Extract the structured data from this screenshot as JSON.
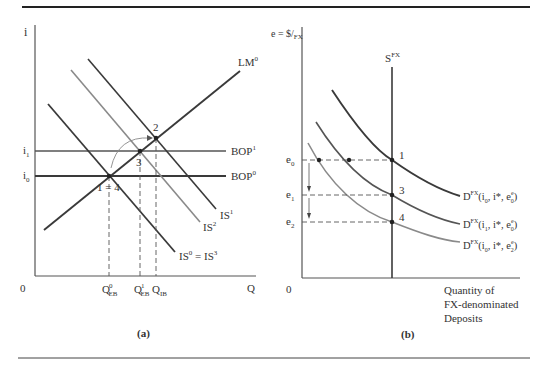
{
  "panel_a": {
    "caption": "(a)",
    "y_axis_label": "i",
    "x_axis_label": "Q",
    "origin_label": "0",
    "y_ticks": [
      {
        "base": "i",
        "sub": "1"
      },
      {
        "base": "i",
        "sub": "0"
      }
    ],
    "x_ticks": [
      {
        "base": "Q",
        "sup": "0",
        "sub": "EB"
      },
      {
        "base": "Q",
        "sup": "1",
        "sub": "EB"
      },
      {
        "base": "Q",
        "sub": "IB"
      }
    ],
    "curves": {
      "lm": {
        "base": "LM",
        "sup": "0"
      },
      "bop1": {
        "base": "BOP",
        "sup": "1"
      },
      "bop0": {
        "base": "BOP",
        "sup": "0"
      },
      "is1": {
        "base": "IS",
        "sup": "1"
      },
      "is2": {
        "base": "IS",
        "sup": "2"
      },
      "is0": {
        "base": "IS",
        "sup": "0",
        "eq": " = IS",
        "sup2": "3"
      }
    },
    "points": {
      "p14": "1 = 4",
      "p2": "2",
      "p3": "3"
    }
  },
  "panel_b": {
    "caption": "(b)",
    "y_axis_label": "e = $/",
    "y_axis_label_sub": "FX",
    "origin_label": "0",
    "x_axis_label_lines": [
      "Quantity of",
      "FX-denominated",
      "Deposits"
    ],
    "y_ticks": [
      {
        "base": "e",
        "sub": "0"
      },
      {
        "base": "e",
        "sub": "1"
      },
      {
        "base": "e",
        "sub": "2"
      }
    ],
    "supply": {
      "base": "S",
      "sup": "FX"
    },
    "demand_curves": [
      {
        "base": "D",
        "sup": "FX",
        "args": "(i",
        "a1": "0",
        "mid": ", i*, e",
        "esup": "e",
        "esub": "0",
        "close": ")"
      },
      {
        "base": "D",
        "sup": "FX",
        "args": "(i",
        "a1": "1",
        "mid": ", i*, e",
        "esup": "e",
        "esub": "0",
        "close": ")"
      },
      {
        "base": "D",
        "sup": "FX",
        "args": "(i",
        "a1": "0",
        "mid": ", i*, e",
        "esup": "e",
        "esub": "2",
        "close": ")"
      }
    ],
    "points": {
      "p1": "1",
      "p3": "3",
      "p4": "4"
    }
  },
  "colors": {
    "dark_line": "#3a3a3a",
    "mid_line": "#555555",
    "light_line": "#8a8a8a",
    "rule": "#222222"
  }
}
